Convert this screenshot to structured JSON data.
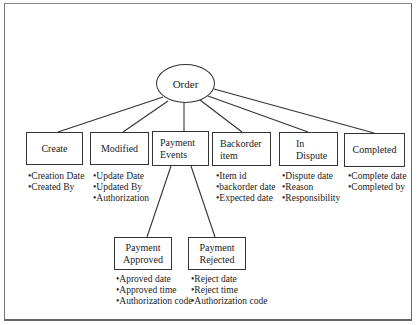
{
  "diagram": {
    "root": {
      "label": "Order",
      "shape": "ellipse"
    },
    "nodes": [
      {
        "id": "create",
        "label": "Create",
        "attributes": [
          "Creation Date",
          "Created By"
        ]
      },
      {
        "id": "modified",
        "label": "Modified",
        "attributes": [
          "Update Date",
          "Updated By",
          "Authorization"
        ]
      },
      {
        "id": "payment-events",
        "label": "Payment\nEvents",
        "attributes": []
      },
      {
        "id": "backorder-item",
        "label": "Backorder\nitem",
        "attributes": [
          "Item id",
          "backorder date",
          "Expected date"
        ]
      },
      {
        "id": "in-dispute",
        "label": "In\nDispute",
        "attributes": [
          "Dispute date",
          "Reason",
          "Responsibility"
        ]
      },
      {
        "id": "completed",
        "label": "Completed",
        "attributes": [
          "Complete date",
          "Completed by"
        ]
      }
    ],
    "payment_children": [
      {
        "id": "payment-approved",
        "label": "Payment\nApproved",
        "attributes": [
          "Aproved date",
          "Approved time",
          "Authorization code"
        ]
      },
      {
        "id": "payment-rejected",
        "label": "Payment\nRejected",
        "attributes": [
          "Reject date",
          "Reject time",
          "Authorization code"
        ]
      }
    ],
    "colors": {
      "line": "#333333",
      "frame": "#777777",
      "background": "#ffffff"
    }
  }
}
